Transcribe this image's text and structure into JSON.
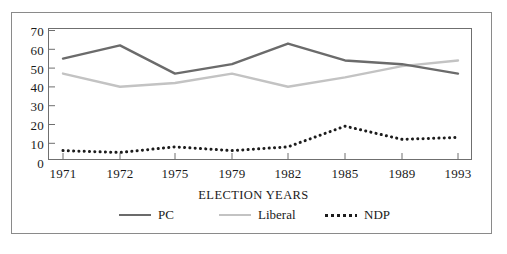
{
  "chart_data": {
    "type": "line",
    "title": "",
    "xlabel": "ELECTION YEARS",
    "ylabel": "",
    "categories": [
      "1971",
      "1972",
      "1975",
      "1979",
      "1982",
      "1985",
      "1989",
      "1993"
    ],
    "ylim": [
      0,
      70
    ],
    "yticks": [
      0,
      10,
      20,
      30,
      40,
      50,
      60,
      70
    ],
    "grid": false,
    "legend_position": "bottom",
    "series": [
      {
        "name": "PC",
        "style": "solid",
        "color": "#6b6b6b",
        "values": [
          54,
          61,
          46,
          51,
          62,
          53,
          51,
          46
        ]
      },
      {
        "name": "Liberal",
        "style": "solid",
        "color": "#c3c3c3",
        "values": [
          46,
          39,
          41,
          46,
          39,
          44,
          50,
          53
        ]
      },
      {
        "name": "NDP",
        "style": "dotted",
        "color": "#1c1c1c",
        "values": [
          5,
          4,
          7,
          5,
          7,
          18,
          11,
          12
        ]
      }
    ]
  },
  "axes": {
    "y_tick_labels": [
      "70",
      "60",
      "50",
      "40",
      "30",
      "20",
      "10",
      "0"
    ],
    "x_tick_labels": [
      "1971",
      "1972",
      "1975",
      "1979",
      "1982",
      "1985",
      "1989",
      "1993"
    ],
    "x_axis_title": "ELECTION YEARS"
  },
  "legend": {
    "items": [
      {
        "label": "PC",
        "swatch": "solid-line-dark-gray"
      },
      {
        "label": "Liberal",
        "swatch": "solid-line-light-gray"
      },
      {
        "label": "NDP",
        "swatch": "dotted-line-black"
      }
    ]
  },
  "colors": {
    "pc": "#6b6b6b",
    "liberal": "#c3c3c3",
    "ndp": "#1c1c1c",
    "frame": "#8a8a8a",
    "plot_border": "#6f6f6f",
    "background": "#ffffff",
    "text": "#1a1a1a"
  }
}
